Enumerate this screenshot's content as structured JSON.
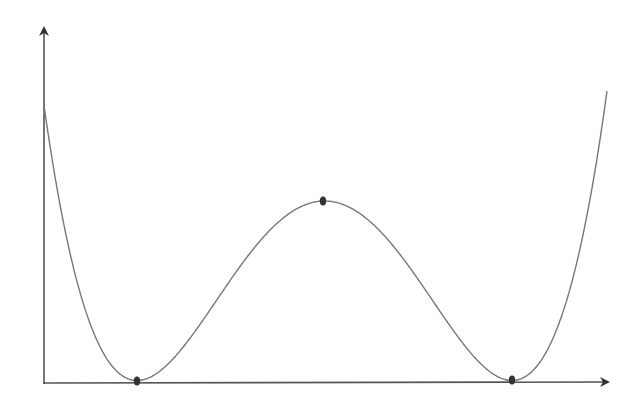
{
  "diagram": {
    "type": "double-well potential curve",
    "axes": {
      "origin": [
        44,
        383
      ],
      "y_axis_top": [
        44,
        27
      ],
      "x_axis_end": [
        609,
        382
      ],
      "color": "#333333"
    },
    "curve": {
      "color": "#777777",
      "start": [
        44,
        100
      ],
      "end": [
        607,
        97
      ]
    },
    "points": [
      {
        "label": "left-minimum",
        "x": 137,
        "y": 381
      },
      {
        "label": "central-maximum",
        "x": 323,
        "y": 201
      },
      {
        "label": "right-minimum",
        "x": 512,
        "y": 380
      }
    ],
    "point_color": "#333333"
  }
}
